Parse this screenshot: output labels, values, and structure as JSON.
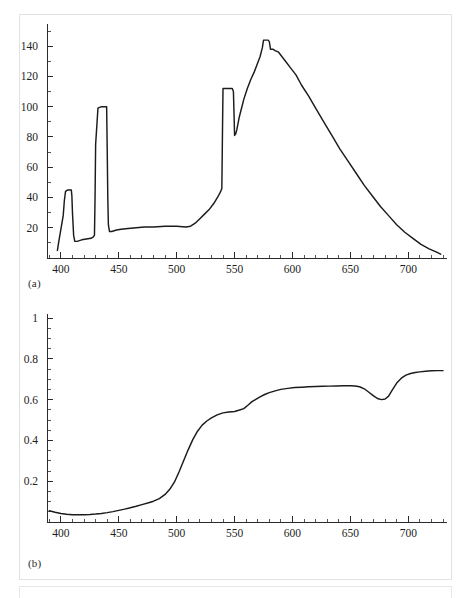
{
  "figure": {
    "panel_a_label": "(a)",
    "panel_b_label": "(b)"
  },
  "chart_data": [
    {
      "id": "panel-a",
      "type": "line",
      "title": "",
      "subtitle": "",
      "xlabel": "",
      "ylabel": "",
      "xlim": [
        388,
        730
      ],
      "ylim": [
        0,
        152
      ],
      "grid": false,
      "legend": null,
      "xticks": [
        400,
        450,
        500,
        550,
        600,
        650,
        700
      ],
      "xtick_labels": [
        "400",
        "450",
        "500",
        "550",
        "600",
        "650",
        "700"
      ],
      "xminor_step": 10,
      "yticks": [
        20,
        40,
        60,
        80,
        100,
        120,
        140
      ],
      "ytick_labels": [
        "20",
        "40",
        "60",
        "80",
        "100",
        "120",
        "140"
      ],
      "yminor_step": 10,
      "series": [
        {
          "name": "relative spectral power",
          "x": [
            397,
            398,
            402,
            403,
            404,
            406,
            408,
            409,
            409.5,
            410,
            411,
            412,
            414,
            418,
            422,
            426,
            428,
            429,
            429.5,
            430,
            432,
            435,
            438,
            439.5,
            440,
            440.5,
            441,
            442,
            444,
            448,
            452,
            458,
            465,
            472,
            480,
            490,
            500,
            508,
            512,
            516,
            520,
            524,
            528,
            532,
            536,
            538,
            539,
            539.5,
            540,
            543,
            546,
            548,
            549,
            549.5,
            550,
            551,
            552,
            553,
            554,
            556,
            558,
            561,
            564,
            567,
            570,
            572,
            574,
            575,
            577,
            579,
            580,
            581,
            583,
            585,
            588,
            591,
            594,
            598,
            603,
            608,
            614,
            620,
            627,
            634,
            641,
            648,
            655,
            662,
            669,
            676,
            683,
            690,
            697,
            704,
            711,
            718,
            724,
            728
          ],
          "y": [
            5,
            10,
            28,
            38,
            44,
            45,
            45,
            45,
            41,
            30,
            15,
            11,
            11,
            12,
            12.5,
            13,
            14,
            15,
            40,
            75,
            99,
            100,
            100,
            100,
            72,
            40,
            22,
            17.5,
            17.5,
            18.5,
            19,
            19.5,
            20,
            20.5,
            20.5,
            21,
            21,
            20.5,
            21,
            23,
            26,
            29,
            32,
            36,
            41,
            44,
            46,
            80,
            112,
            112,
            112,
            112,
            110,
            96,
            81,
            82,
            85,
            89,
            93,
            99,
            105,
            112,
            118,
            123,
            129,
            133,
            139,
            144,
            144,
            144,
            143,
            138,
            138,
            137,
            136,
            133,
            130,
            126,
            121,
            114,
            107,
            99,
            90,
            81,
            72,
            64,
            56,
            48,
            41,
            34,
            28,
            22,
            17,
            13,
            9,
            6,
            4,
            2.5,
            2
          ]
        }
      ]
    },
    {
      "id": "panel-b",
      "type": "line",
      "title": "",
      "subtitle": "",
      "xlabel": "",
      "ylabel": "",
      "xlim": [
        388,
        730
      ],
      "ylim": [
        0,
        1.0
      ],
      "grid": false,
      "legend": null,
      "xticks": [
        400,
        450,
        500,
        550,
        600,
        650,
        700
      ],
      "xtick_labels": [
        "400",
        "450",
        "500",
        "550",
        "600",
        "650",
        "700"
      ],
      "xminor_step": 10,
      "yticks": [
        0.2,
        0.4,
        0.6,
        0.8,
        1
      ],
      "ytick_labels": [
        "0.2",
        "0.4",
        "0.6",
        "0.8",
        "1"
      ],
      "yminor_step": 0.05,
      "series": [
        {
          "name": "spectral reflectance",
          "x": [
            390,
            395,
            400,
            405,
            410,
            415,
            420,
            425,
            430,
            435,
            440,
            445,
            450,
            455,
            460,
            465,
            470,
            475,
            480,
            485,
            490,
            494,
            498,
            502,
            506,
            510,
            514,
            518,
            522,
            526,
            530,
            535,
            540,
            545,
            550,
            555,
            558,
            562,
            565,
            568,
            572,
            576,
            580,
            585,
            590,
            596,
            602,
            608,
            614,
            620,
            626,
            632,
            638,
            644,
            650,
            654,
            658,
            662,
            666,
            670,
            674,
            677,
            680,
            683,
            686,
            690,
            694,
            698,
            702,
            706,
            710,
            715,
            720,
            725,
            730
          ],
          "y": [
            0.055,
            0.048,
            0.042,
            0.038,
            0.036,
            0.036,
            0.036,
            0.037,
            0.039,
            0.042,
            0.046,
            0.051,
            0.057,
            0.063,
            0.07,
            0.077,
            0.085,
            0.093,
            0.102,
            0.115,
            0.135,
            0.16,
            0.195,
            0.245,
            0.3,
            0.355,
            0.405,
            0.445,
            0.475,
            0.495,
            0.51,
            0.525,
            0.535,
            0.539,
            0.542,
            0.55,
            0.556,
            0.575,
            0.59,
            0.6,
            0.613,
            0.625,
            0.634,
            0.643,
            0.65,
            0.655,
            0.659,
            0.661,
            0.663,
            0.664,
            0.665,
            0.666,
            0.667,
            0.668,
            0.668,
            0.667,
            0.663,
            0.653,
            0.636,
            0.618,
            0.604,
            0.6,
            0.603,
            0.617,
            0.645,
            0.681,
            0.705,
            0.72,
            0.728,
            0.733,
            0.736,
            0.739,
            0.741,
            0.742,
            0.742
          ]
        }
      ]
    }
  ]
}
